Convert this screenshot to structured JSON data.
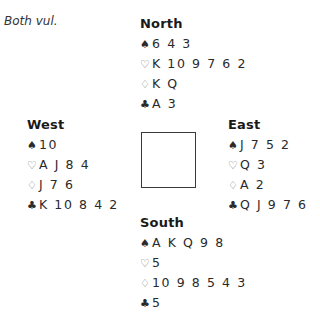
{
  "vulnerability": "Both vul.",
  "suit_symbols": {
    "spades": "♠",
    "hearts": "♡",
    "diamonds": "♢",
    "clubs": "♣"
  },
  "hands": {
    "north": {
      "name": "North",
      "spades": "6 4 3",
      "hearts": "K 10 9 7 6 2",
      "diamonds": "K Q",
      "clubs": "A 3"
    },
    "west": {
      "name": "West",
      "spades": "10",
      "hearts": "A J 8 4",
      "diamonds": "J 7 6",
      "clubs": "K 10 8 4 2"
    },
    "east": {
      "name": "East",
      "spades": "J 7 5 2",
      "hearts": "Q 3",
      "diamonds": "A 2",
      "clubs": "Q J 9 7 6"
    },
    "south": {
      "name": "South",
      "spades": "A K Q 9 8",
      "hearts": "5",
      "diamonds": "10 9 8 5 4 3",
      "clubs": "5"
    }
  }
}
